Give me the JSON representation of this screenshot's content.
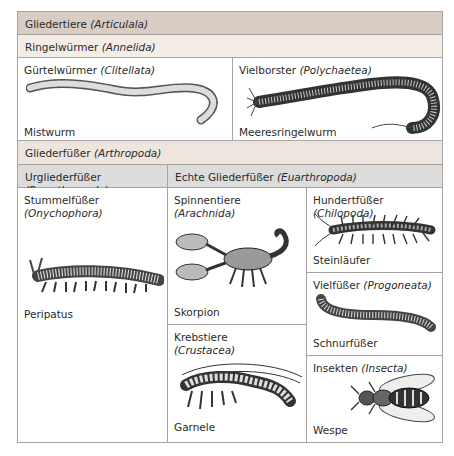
{
  "title": {
    "common": "Gliedertiere",
    "latin": "(Articulala)"
  },
  "annelida": {
    "header": {
      "common": "Ringelwürmer",
      "latin": "(Annelida)"
    },
    "cells": [
      {
        "common": "Gürtelwürmer",
        "latin": "(Clitellata)",
        "example": "Mistwurm",
        "icon": "earthworm-illustration"
      },
      {
        "common": "Vielborster",
        "latin": "(Polychaetea)",
        "example": "Meeresringelwurm",
        "icon": "bristle-worm-illustration"
      }
    ]
  },
  "arthropoda": {
    "header": {
      "common": "Gliederfüßer",
      "latin": "(Arthropoda)"
    },
    "sub_headers": [
      {
        "common": "Urgliederfüßer",
        "latin": "(Proarthropoda)"
      },
      {
        "common": "Echte Gliederfüßer",
        "latin": "(Euarthropoda)"
      }
    ],
    "cells": [
      {
        "common": "Stummelfüßer",
        "latin": "(Onychophora)",
        "example": "Peripatus",
        "icon": "velvet-worm-illustration"
      },
      {
        "common": "Spinnentiere",
        "latin": "(Arachnida)",
        "example": "Skorpion",
        "icon": "scorpion-illustration"
      },
      {
        "common": "Krebstiere",
        "latin": "(Crustacea)",
        "example": "Garnele",
        "icon": "shrimp-illustration"
      },
      {
        "common": "Hundertfüßer",
        "latin": "(Chilopoda)",
        "example": "Steinläufer",
        "icon": "centipede-illustration"
      },
      {
        "common": "Vielfüßer",
        "latin": "(Progoneata)",
        "example": "Schnurfüßer",
        "icon": "millipede-illustration"
      },
      {
        "common": "Insekten",
        "latin": "(Insecta)",
        "example": "Wespe",
        "icon": "wasp-illustration"
      }
    ]
  },
  "colors": {
    "header_main": "#d8ccc3",
    "header_annelida": "#f3ede6",
    "header_arthropoda": "#eee6de",
    "header_sub": "#dcdcdc",
    "border": "#a8a2a0"
  }
}
